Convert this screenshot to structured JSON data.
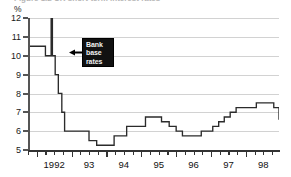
{
  "figure": {
    "caption": "Figure 1.2  UK short-term interest rates",
    "unit_label": "%"
  },
  "annotation": {
    "name": "bank-base-rates-callout",
    "lines": [
      "Bank",
      "base",
      "rates"
    ],
    "box_color": "#111111",
    "text_color": "#f2f2f2",
    "arrow_direction": "left"
  },
  "axes": {
    "y": {
      "ticks": [
        "12",
        "11",
        "10",
        "9",
        "8",
        "7",
        "6",
        "5"
      ],
      "min": 5,
      "max": 12,
      "unit": "%"
    },
    "x": {
      "labels": [
        "1992",
        "93",
        "94",
        "95",
        "96",
        "97",
        "98"
      ],
      "label_positions": [
        1992.5,
        1993.5,
        1994.5,
        1995.5,
        1996.5,
        1997.5,
        1998.5
      ],
      "min": 1991.75,
      "max": 1998.95,
      "minor_tick_interval": 0.25,
      "major_tick_interval": 1
    }
  },
  "chart_data": {
    "type": "line",
    "line_style": "step",
    "title": "Figure 1.2  UK short-term interest rates",
    "subtitle": "",
    "xlabel": "",
    "ylabel": "%",
    "ylim": [
      5,
      12
    ],
    "xlim": [
      1991.75,
      1998.95
    ],
    "grid": true,
    "grid_axis": "y",
    "legend": "none",
    "annotations": [
      {
        "text": "Bank base rates",
        "x": 1992.55,
        "y": 11.0,
        "points_to": [
          1992.42,
          11.0
        ]
      }
    ],
    "series": [
      {
        "name": "Bank base rates",
        "color": "#2b2b2b",
        "x": [
          1991.75,
          1992.05,
          1992.25,
          1992.42,
          1992.45,
          1992.53,
          1992.62,
          1992.72,
          1992.8,
          1992.95,
          1993.25,
          1993.5,
          1993.72,
          1994.05,
          1994.22,
          1994.4,
          1994.58,
          1995.12,
          1995.42,
          1995.58,
          1995.8,
          1996.0,
          1996.18,
          1996.48,
          1996.72,
          1996.88,
          1997.05,
          1997.22,
          1997.38,
          1997.55,
          1997.72,
          1998.02,
          1998.3,
          1998.62,
          1998.8,
          1998.95
        ],
        "y": [
          10.5,
          10.5,
          10.0,
          12.0,
          10.0,
          9.0,
          8.0,
          7.0,
          6.0,
          6.0,
          6.0,
          5.5,
          5.25,
          5.25,
          5.75,
          5.75,
          6.25,
          6.75,
          6.75,
          6.5,
          6.25,
          6.0,
          5.75,
          5.75,
          6.0,
          6.0,
          6.25,
          6.5,
          6.75,
          7.0,
          7.25,
          7.25,
          7.5,
          7.5,
          7.25,
          6.6
        ]
      }
    ]
  }
}
